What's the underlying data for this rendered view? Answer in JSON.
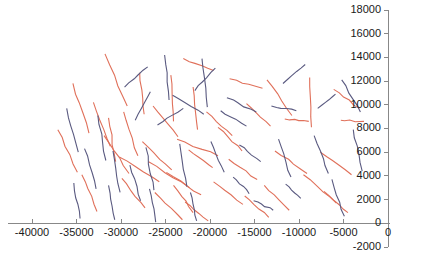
{
  "chart_data": {
    "type": "line",
    "title": "",
    "subtitle": "",
    "xlabel": "",
    "ylabel": "",
    "xlim": [
      -42000,
      1500
    ],
    "ylim": [
      -2000,
      18000
    ],
    "grid": false,
    "legend": null,
    "background_color": "#ffffff",
    "axis_color": "#888888",
    "label_color": "#1a1a1a",
    "series_colors": {
      "red": "#e0705a",
      "blue": "#5a5a80"
    },
    "xticks": [
      -40000,
      -35000,
      -30000,
      -25000,
      -20000,
      -15000,
      -10000,
      -5000,
      0
    ],
    "xtick_labels": [
      "-40000",
      "-35000",
      "-30000",
      "-25000",
      "-20000",
      "-15000",
      "-10000",
      "-5000",
      "0"
    ],
    "yticks": [
      -2000,
      0,
      2000,
      4000,
      6000,
      8000,
      10000,
      12000,
      14000,
      16000,
      18000
    ],
    "ytick_labels": [
      "-2000",
      "0",
      "2000",
      "4000",
      "6000",
      "8000",
      "10000",
      "12000",
      "14000",
      "16000",
      "18000"
    ],
    "series": [
      {
        "name": "red",
        "color": "#e0705a",
        "segments": [
          [
            [
              -31800,
              14300
            ],
            [
              -29300,
              9900
            ]
          ],
          [
            [
              -27900,
              12700
            ],
            [
              -27400,
              9200
            ]
          ],
          [
            [
              -23000,
              13900
            ],
            [
              -19600,
              12900
            ]
          ],
          [
            [
              -17800,
              12200
            ],
            [
              -14100,
              11400
            ]
          ],
          [
            [
              -24400,
              12500
            ],
            [
              -24100,
              8600
            ]
          ],
          [
            [
              -21900,
              11500
            ],
            [
              -21400,
              7900
            ]
          ],
          [
            [
              -13600,
              12100
            ],
            [
              -10800,
              9100
            ]
          ],
          [
            [
              -8800,
              12300
            ],
            [
              -8600,
              8100
            ]
          ],
          [
            [
              -6100,
              11300
            ],
            [
              -3200,
              9700
            ]
          ],
          [
            [
              -35400,
              11800
            ],
            [
              -33600,
              7600
            ]
          ],
          [
            [
              -33100,
              10200
            ],
            [
              -31200,
              6500
            ]
          ],
          [
            [
              -29700,
              9400
            ],
            [
              -28100,
              5700
            ]
          ],
          [
            [
              -26400,
              9900
            ],
            [
              -23600,
              7300
            ]
          ],
          [
            [
              -20400,
              9400
            ],
            [
              -17500,
              7400
            ]
          ],
          [
            [
              -15900,
              10100
            ],
            [
              -13200,
              8200
            ]
          ],
          [
            [
              -11600,
              8800
            ],
            [
              -8900,
              8600
            ]
          ],
          [
            [
              -5300,
              8700
            ],
            [
              -2700,
              8600
            ]
          ],
          [
            [
              -37100,
              7900
            ],
            [
              -34900,
              4300
            ]
          ],
          [
            [
              -31900,
              7400
            ],
            [
              -29100,
              4200
            ]
          ],
          [
            [
              -27600,
              6900
            ],
            [
              -24300,
              4500
            ]
          ],
          [
            [
              -22400,
              6200
            ],
            [
              -19700,
              4700
            ]
          ],
          [
            [
              -30200,
              5600
            ],
            [
              -25700,
              3500
            ]
          ],
          [
            [
              -26900,
              5200
            ],
            [
              -22300,
              3000
            ]
          ],
          [
            [
              -24900,
              4300
            ],
            [
              -21000,
              2400
            ]
          ],
          [
            [
              -17900,
              5400
            ],
            [
              -14700,
              3700
            ]
          ],
          [
            [
              -12700,
              6100
            ],
            [
              -9100,
              4200
            ]
          ],
          [
            [
              -7600,
              6000
            ],
            [
              -4100,
              4100
            ]
          ],
          [
            [
              -9500,
              4100
            ],
            [
              -5800,
              1700
            ]
          ],
          [
            [
              -34400,
              4100
            ],
            [
              -32700,
              1000
            ]
          ],
          [
            [
              -29900,
              3800
            ],
            [
              -27300,
              1300
            ]
          ],
          [
            [
              -24100,
              3200
            ],
            [
              -21900,
              900
            ]
          ],
          [
            [
              -19600,
              3500
            ],
            [
              -16300,
              1600
            ]
          ],
          [
            [
              -13900,
              3200
            ],
            [
              -11100,
              1100
            ]
          ],
          [
            [
              -7200,
              2700
            ],
            [
              -4500,
              900
            ]
          ],
          [
            [
              -26200,
              2600
            ],
            [
              -23100,
              300
            ]
          ],
          [
            [
              -22800,
              1800
            ],
            [
              -20200,
              200
            ]
          ],
          [
            [
              -31400,
              8900
            ],
            [
              -30600,
              5200
            ]
          ],
          [
            [
              -19100,
              8100
            ],
            [
              -16400,
              6100
            ]
          ],
          [
            [
              -23700,
              7100
            ],
            [
              -19100,
              5700
            ]
          ],
          [
            [
              -16100,
              2300
            ],
            [
              -13400,
              500
            ]
          ]
        ]
      },
      {
        "name": "blue",
        "color": "#5a5a80",
        "segments": [
          [
            [
              -25100,
              14200
            ],
            [
              -24600,
              10400
            ]
          ],
          [
            [
              -20900,
              13900
            ],
            [
              -20300,
              9800
            ]
          ],
          [
            [
              -29600,
              11500
            ],
            [
              -27000,
              13200
            ]
          ],
          [
            [
              -21700,
              11200
            ],
            [
              -19400,
              13100
            ]
          ],
          [
            [
              -11800,
              11800
            ],
            [
              -9300,
              13400
            ]
          ],
          [
            [
              -5200,
              12100
            ],
            [
              -3100,
              9400
            ]
          ],
          [
            [
              -36100,
              9700
            ],
            [
              -34800,
              6000
            ]
          ],
          [
            [
              -32600,
              9100
            ],
            [
              -31700,
              5300
            ]
          ],
          [
            [
              -28400,
              8700
            ],
            [
              -26700,
              11100
            ]
          ],
          [
            [
              -25900,
              8300
            ],
            [
              -23000,
              9700
            ]
          ],
          [
            [
              -18800,
              9500
            ],
            [
              -15900,
              8200
            ]
          ],
          [
            [
              -13100,
              9900
            ],
            [
              -10300,
              9500
            ]
          ],
          [
            [
              -7900,
              9700
            ],
            [
              -5900,
              10900
            ]
          ],
          [
            [
              -34100,
              6300
            ],
            [
              -32800,
              2900
            ]
          ],
          [
            [
              -30900,
              6100
            ],
            [
              -30100,
              2600
            ]
          ],
          [
            [
              -27200,
              6400
            ],
            [
              -26300,
              2800
            ]
          ],
          [
            [
              -23400,
              6700
            ],
            [
              -22600,
              3100
            ]
          ],
          [
            [
              -19900,
              6900
            ],
            [
              -18400,
              4300
            ]
          ],
          [
            [
              -16700,
              6600
            ],
            [
              -14300,
              5200
            ]
          ],
          [
            [
              -12300,
              7100
            ],
            [
              -10900,
              3900
            ]
          ],
          [
            [
              -8300,
              7400
            ],
            [
              -6700,
              4200
            ]
          ],
          [
            [
              -3900,
              7900
            ],
            [
              -2900,
              4400
            ]
          ],
          [
            [
              -35300,
              3400
            ],
            [
              -34600,
              400
            ]
          ],
          [
            [
              -31400,
              3200
            ],
            [
              -30700,
              300
            ]
          ],
          [
            [
              -26800,
              2900
            ],
            [
              -26100,
              100
            ]
          ],
          [
            [
              -22200,
              2600
            ],
            [
              -21500,
              200
            ]
          ],
          [
            [
              -17400,
              3900
            ],
            [
              -15600,
              2500
            ]
          ],
          [
            [
              -11500,
              3300
            ],
            [
              -9800,
              2100
            ]
          ],
          [
            [
              -6300,
              3700
            ],
            [
              -4900,
              600
            ]
          ],
          [
            [
              -24200,
              10800
            ],
            [
              -20700,
              9200
            ]
          ],
          [
            [
              -18100,
              10600
            ],
            [
              -14800,
              9400
            ]
          ],
          [
            [
              -29000,
              4900
            ],
            [
              -27800,
              1900
            ]
          ],
          [
            [
              -15100,
              1900
            ],
            [
              -12900,
              1100
            ]
          ]
        ]
      }
    ]
  }
}
